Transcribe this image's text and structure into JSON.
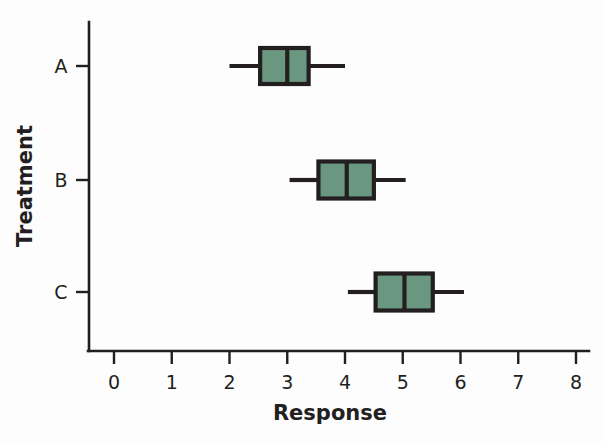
{
  "chart_data": {
    "type": "box",
    "title": "",
    "orientation": "horizontal",
    "xlabel": "Response",
    "ylabel": "Treatment",
    "xlim": [
      0,
      8
    ],
    "x_ticks": [
      0,
      1,
      2,
      3,
      4,
      5,
      6,
      7,
      8
    ],
    "x_tick_labels": [
      "0",
      "1",
      "2",
      "3",
      "4",
      "5",
      "6",
      "7",
      "8"
    ],
    "categories": [
      "A",
      "B",
      "C"
    ],
    "grid": false,
    "legend": "none",
    "box_fill_color": "#69977f",
    "box_edge_color": "#231f20",
    "background_color": "#fdfdfd",
    "boxes": [
      {
        "category": "A",
        "whisker_low": 2.0,
        "q1": 2.53,
        "median": 3.0,
        "q3": 3.37,
        "whisker_high": 4.0
      },
      {
        "category": "B",
        "whisker_low": 3.04,
        "q1": 3.54,
        "median": 4.03,
        "q3": 4.5,
        "whisker_high": 5.05
      },
      {
        "category": "C",
        "whisker_low": 4.05,
        "q1": 4.53,
        "median": 5.03,
        "q3": 5.52,
        "whisker_high": 6.06
      }
    ]
  },
  "labels": {
    "x_axis_title": "Response",
    "y_axis_title": "Treatment",
    "tick_0": "0",
    "tick_1": "1",
    "tick_2": "2",
    "tick_3": "3",
    "tick_4": "4",
    "tick_5": "5",
    "tick_6": "6",
    "tick_7": "7",
    "tick_8": "8",
    "cat_a": "A",
    "cat_b": "B",
    "cat_c": "C"
  }
}
